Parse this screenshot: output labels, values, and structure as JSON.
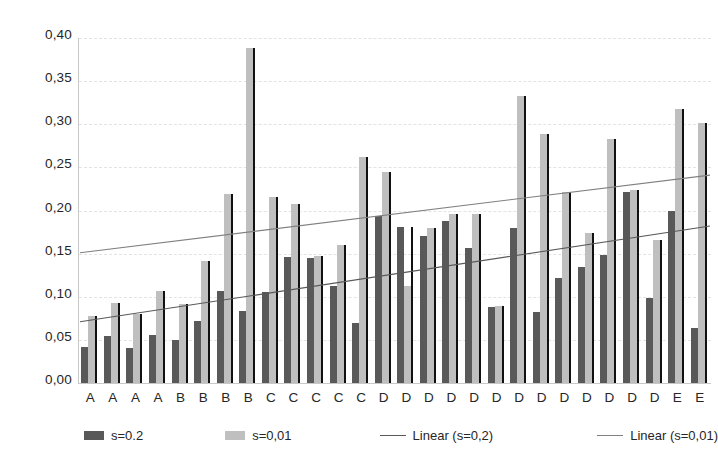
{
  "chart_data": {
    "type": "bar",
    "title": "",
    "xlabel": "",
    "ylabel": "",
    "ylim": [
      0.0,
      0.4
    ],
    "grid": true,
    "legend_position": "bottom",
    "y_ticks": [
      "0,00",
      "0,05",
      "0,10",
      "0,15",
      "0,20",
      "0,25",
      "0,30",
      "0,35",
      "0,40"
    ],
    "y_tick_values": [
      0.0,
      0.05,
      0.1,
      0.15,
      0.2,
      0.25,
      0.3,
      0.35,
      0.4
    ],
    "categories": [
      "A",
      "A",
      "A",
      "A",
      "B",
      "B",
      "B",
      "B",
      "C",
      "C",
      "C",
      "C",
      "C",
      "D",
      "D",
      "D",
      "D",
      "D",
      "D",
      "D",
      "D",
      "D",
      "D",
      "D",
      "D",
      "D",
      "E",
      "E"
    ],
    "series": [
      {
        "name": "s=0.2",
        "color": "#595959",
        "values": [
          0.042,
          0.054,
          0.041,
          0.056,
          0.05,
          0.072,
          0.107,
          0.083,
          0.106,
          0.146,
          0.145,
          0.112,
          0.07,
          0.194,
          0.181,
          0.171,
          0.188,
          0.157,
          0.088,
          0.18,
          0.082,
          0.122,
          0.134,
          0.149,
          0.222,
          0.098,
          0.2,
          0.064
        ]
      },
      {
        "name": "s=0,01",
        "color": "#bfbfbf",
        "values": [
          0.078,
          0.093,
          0.08,
          0.107,
          0.092,
          0.142,
          0.219,
          0.388,
          0.216,
          0.208,
          0.147,
          0.16,
          0.262,
          0.245,
          0.112,
          0.18,
          0.196,
          0.196,
          0.089,
          0.333,
          0.289,
          0.222,
          0.174,
          0.283,
          0.224,
          0.166,
          0.318,
          0.302
        ]
      }
    ],
    "trendlines": [
      {
        "name": "Linear (s=0,2)",
        "color": "#595959",
        "y_start": 0.071,
        "y_end": 0.182
      },
      {
        "name": "Linear (s=0,01)",
        "color": "#808080",
        "y_start": 0.151,
        "y_end": 0.241
      }
    ],
    "legend": [
      {
        "label": "s=0.2",
        "type": "bar",
        "color": "#595959"
      },
      {
        "label": "s=0,01",
        "type": "bar",
        "color": "#bfbfbf"
      },
      {
        "label": "Linear (s=0,2)",
        "type": "line",
        "color": "#595959"
      },
      {
        "label": "Linear (s=0,01)",
        "type": "line",
        "color": "#808080"
      }
    ]
  }
}
